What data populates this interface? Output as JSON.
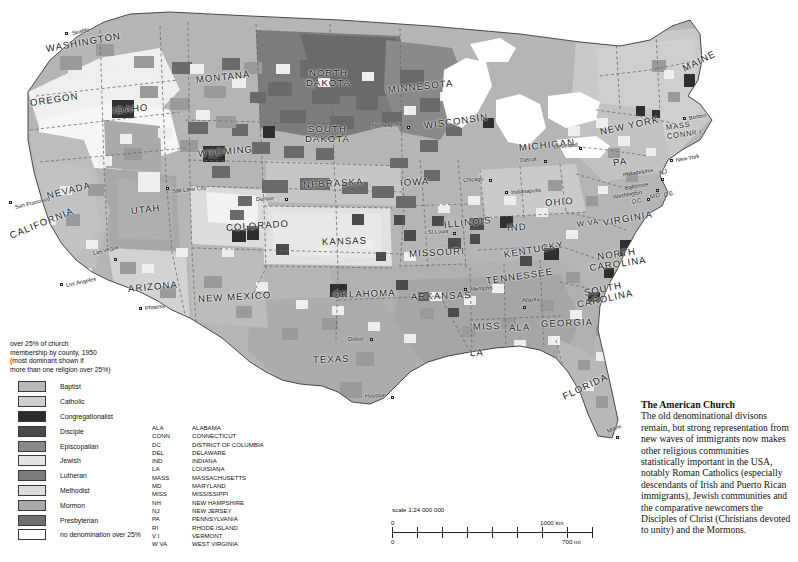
{
  "map": {
    "title": "The American Church",
    "states": [
      {
        "name": "WASHINGTON",
        "x": 46,
        "y": 43,
        "rot": -10,
        "size": "md"
      },
      {
        "name": "OREGON",
        "x": 30,
        "y": 97,
        "rot": -8,
        "size": "md"
      },
      {
        "name": "IDAHO",
        "x": 113,
        "y": 105,
        "rot": -6,
        "size": "md"
      },
      {
        "name": "MONTANA",
        "x": 196,
        "y": 74,
        "rot": -6,
        "size": "md"
      },
      {
        "name": "WYOMING",
        "x": 198,
        "y": 148,
        "rot": -5,
        "size": "md"
      },
      {
        "name": "NORTH DAKOTA",
        "x": 306,
        "y": 68,
        "rot": 0,
        "size": "md2"
      },
      {
        "name": "SOUTH DAKOTA",
        "x": 305,
        "y": 124,
        "rot": 0,
        "size": "md2"
      },
      {
        "name": "MINNESOTA",
        "x": 388,
        "y": 84,
        "rot": -6,
        "size": "md"
      },
      {
        "name": "WISCONSIN",
        "x": 424,
        "y": 120,
        "rot": -8,
        "size": "md"
      },
      {
        "name": "MICHIGAN",
        "x": 519,
        "y": 142,
        "rot": -6,
        "size": "md"
      },
      {
        "name": "NEVADA",
        "x": 47,
        "y": 190,
        "rot": -14,
        "size": "md"
      },
      {
        "name": "UTAH",
        "x": 131,
        "y": 205,
        "rot": -6,
        "size": "md"
      },
      {
        "name": "CALIFORNIA",
        "x": 10,
        "y": 230,
        "rot": -22,
        "size": "md"
      },
      {
        "name": "ARIZONA",
        "x": 128,
        "y": 283,
        "rot": -5,
        "size": "md"
      },
      {
        "name": "NEW MEXICO",
        "x": 198,
        "y": 293,
        "rot": -3,
        "size": "md"
      },
      {
        "name": "COLORADO",
        "x": 226,
        "y": 222,
        "rot": -4,
        "size": "md"
      },
      {
        "name": "NEBRASKA",
        "x": 303,
        "y": 179,
        "rot": -3,
        "size": "md"
      },
      {
        "name": "KANSAS",
        "x": 322,
        "y": 236,
        "rot": -2,
        "size": "md"
      },
      {
        "name": "OKLAHOMA",
        "x": 333,
        "y": 289,
        "rot": -2,
        "size": "md"
      },
      {
        "name": "TEXAS",
        "x": 313,
        "y": 354,
        "rot": -2,
        "size": "md"
      },
      {
        "name": "IOWA",
        "x": 400,
        "y": 177,
        "rot": -3,
        "size": "md"
      },
      {
        "name": "MISSOURI",
        "x": 409,
        "y": 248,
        "rot": -3,
        "size": "md"
      },
      {
        "name": "ILLINOIS",
        "x": 444,
        "y": 219,
        "rot": -6,
        "size": "md"
      },
      {
        "name": "IND",
        "x": 507,
        "y": 222,
        "rot": -4,
        "size": "md"
      },
      {
        "name": "OHIO",
        "x": 545,
        "y": 197,
        "rot": -4,
        "size": "md"
      },
      {
        "name": "ARKANSAS",
        "x": 411,
        "y": 291,
        "rot": -2,
        "size": "md"
      },
      {
        "name": "LA",
        "x": 470,
        "y": 347,
        "rot": -2,
        "size": "md"
      },
      {
        "name": "MISS",
        "x": 473,
        "y": 321,
        "rot": -2,
        "size": "md"
      },
      {
        "name": "ALA",
        "x": 509,
        "y": 322,
        "rot": -2,
        "size": "md"
      },
      {
        "name": "GEORGIA",
        "x": 541,
        "y": 318,
        "rot": -2,
        "size": "md"
      },
      {
        "name": "FLORIDA",
        "x": 563,
        "y": 391,
        "rot": -25,
        "size": "md"
      },
      {
        "name": "TENNESSEE",
        "x": 486,
        "y": 275,
        "rot": -8,
        "size": "md"
      },
      {
        "name": "KENTUCKY",
        "x": 504,
        "y": 249,
        "rot": -10,
        "size": "md"
      },
      {
        "name": "W VA",
        "x": 577,
        "y": 220,
        "rot": -8,
        "size": "sm"
      },
      {
        "name": "VIRGINIA",
        "x": 603,
        "y": 217,
        "rot": -10,
        "size": "md"
      },
      {
        "name": "NORTH CAROLINA",
        "x": 589,
        "y": 253,
        "rot": -8,
        "size": "md2"
      },
      {
        "name": "SOUTH CAROLINA",
        "x": 576,
        "y": 290,
        "rot": -12,
        "size": "md2"
      },
      {
        "name": "NEW YORK",
        "x": 600,
        "y": 126,
        "rot": -12,
        "size": "md"
      },
      {
        "name": "PA",
        "x": 613,
        "y": 157,
        "rot": -8,
        "size": "md"
      },
      {
        "name": "MAINE",
        "x": 683,
        "y": 63,
        "rot": -26,
        "size": "md"
      },
      {
        "name": "MASS",
        "x": 666,
        "y": 123,
        "rot": -8,
        "size": "sm"
      },
      {
        "name": "CONN",
        "x": 667,
        "y": 132,
        "rot": -8,
        "size": "sm"
      },
      {
        "name": "R I",
        "x": 692,
        "y": 129,
        "rot": -8,
        "size": "xs"
      },
      {
        "name": "NJ",
        "x": 659,
        "y": 169,
        "rot": -10,
        "size": "xs"
      },
      {
        "name": "MD",
        "x": 650,
        "y": 193,
        "rot": -14,
        "size": "xs"
      },
      {
        "name": "DE",
        "x": 664,
        "y": 191,
        "rot": -14,
        "size": "xs"
      },
      {
        "name": "DC",
        "x": 632,
        "y": 198,
        "rot": -12,
        "size": "xs"
      }
    ],
    "cities": [
      {
        "name": "Seattle",
        "x": 72,
        "y": 30,
        "rot": -12,
        "dx": -7,
        "dy": 2
      },
      {
        "name": "San Francisco",
        "x": 15,
        "y": 204,
        "rot": -14,
        "dx": -6,
        "dy": -3
      },
      {
        "name": "Los Angeles",
        "x": 66,
        "y": 282,
        "rot": -12,
        "dx": -6,
        "dy": 1
      },
      {
        "name": "Las Vegas",
        "x": 93,
        "y": 250,
        "rot": -14,
        "dx": 21,
        "dy": 8
      },
      {
        "name": "Salt Lake City",
        "x": 172,
        "y": 188,
        "rot": -6,
        "dx": -6,
        "dy": -1
      },
      {
        "name": "Phoenix",
        "x": 145,
        "y": 305,
        "rot": -6,
        "dx": -6,
        "dy": 2
      },
      {
        "name": "Denver",
        "x": 256,
        "y": 196,
        "rot": -3,
        "dx": 29,
        "dy": 2
      },
      {
        "name": "Dallas",
        "x": 348,
        "y": 336,
        "rot": -2,
        "dx": 22,
        "dy": 2
      },
      {
        "name": "Houston",
        "x": 365,
        "y": 393,
        "rot": -3,
        "dx": 26,
        "dy": 3
      },
      {
        "name": "Minneapolis",
        "x": 372,
        "y": 123,
        "rot": -4,
        "dx": 35,
        "dy": 3
      },
      {
        "name": "St Louis",
        "x": 428,
        "y": 229,
        "rot": -3,
        "dx": 25,
        "dy": 3
      },
      {
        "name": "Chicago",
        "x": 463,
        "y": 177,
        "rot": -4,
        "dx": 26,
        "dy": 2
      },
      {
        "name": "Memphis",
        "x": 470,
        "y": 286,
        "rot": -4,
        "dx": -6,
        "dy": 2
      },
      {
        "name": "Atlanta",
        "x": 522,
        "y": 297,
        "rot": -3,
        "dx": 1,
        "dy": 9
      },
      {
        "name": "Detroit",
        "x": 520,
        "y": 157,
        "rot": -4,
        "dx": 24,
        "dy": 3
      },
      {
        "name": "Cleveland",
        "x": 553,
        "y": 144,
        "rot": -6,
        "dx": 26,
        "dy": 3
      },
      {
        "name": "Indianapolis",
        "x": 511,
        "y": 189,
        "rot": -4,
        "dx": -6,
        "dy": 2
      },
      {
        "name": "Miami",
        "x": 607,
        "y": 428,
        "rot": -20,
        "dx": 9,
        "dy": 8
      },
      {
        "name": "Boston",
        "x": 689,
        "y": 115,
        "rot": -10,
        "dx": -6,
        "dy": 2
      },
      {
        "name": "New York",
        "x": 676,
        "y": 157,
        "rot": -10,
        "dx": -6,
        "dy": 2
      },
      {
        "name": "Philadelphia",
        "x": 623,
        "y": 172,
        "rot": -10,
        "dx": 38,
        "dy": 6
      },
      {
        "name": "Baltimore",
        "x": 625,
        "y": 185,
        "rot": -10,
        "dx": 31,
        "dy": 4
      },
      {
        "name": "Washington",
        "x": 613,
        "y": 194,
        "rot": -10,
        "dx": 34,
        "dy": 4
      }
    ]
  },
  "legend": {
    "header": "over 25% of church membership by county, 1950 (most dominant shown if more than one religion over 25%)",
    "header_lines": [
      "over 25% of church",
      "membership by county, 1950",
      "(most dominant shown if",
      "more than one religion over 25%)"
    ],
    "items": [
      {
        "label": "Baptist",
        "color": "#b9b9b9"
      },
      {
        "label": "Catholic",
        "color": "#cfcfcf"
      },
      {
        "label": "Congregationalist",
        "color": "#2c2c2c"
      },
      {
        "label": "Disciple",
        "color": "#4a4a4a"
      },
      {
        "label": "Episcopalian",
        "color": "#888888"
      },
      {
        "label": "Jewish",
        "color": "#e4e4e4"
      },
      {
        "label": "Lutheran",
        "color": "#7c7c7c"
      },
      {
        "label": "Methodist",
        "color": "#dcdcdc"
      },
      {
        "label": "Mormon",
        "color": "#a8a8a8"
      },
      {
        "label": "Presbyterian",
        "color": "#6e6e6e"
      },
      {
        "label": "no denomination over 25%",
        "color": "#ffffff"
      }
    ]
  },
  "abbreviations": [
    {
      "abbr": "ALA",
      "full": "ALABAMA"
    },
    {
      "abbr": "CONN",
      "full": "CONNECTICUT"
    },
    {
      "abbr": "DC",
      "full": "DISTRICT OF COLUMBIA"
    },
    {
      "abbr": "DEL",
      "full": "DELAWARE"
    },
    {
      "abbr": "IND",
      "full": "INDIANA"
    },
    {
      "abbr": "LA",
      "full": "LOUISIANA"
    },
    {
      "abbr": "MASS",
      "full": "MASSACHUSETTS"
    },
    {
      "abbr": "MD",
      "full": "MARYLAND"
    },
    {
      "abbr": "MISS",
      "full": "MISSISSIPPI"
    },
    {
      "abbr": "NH",
      "full": "NEW HAMPSHIRE"
    },
    {
      "abbr": "NJ",
      "full": "NEW JERSEY"
    },
    {
      "abbr": "PA",
      "full": "PENNSYLVANIA"
    },
    {
      "abbr": "RI",
      "full": "RHODE ISLAND"
    },
    {
      "abbr": "V I",
      "full": "VERMONT"
    },
    {
      "abbr": "W VA",
      "full": "WEST VIRGINIA"
    }
  ],
  "scale": {
    "title": "scale 1:24 000 000",
    "zero_km": "0",
    "max_km": "1000 km",
    "zero_mi": "0",
    "max_mi": "700 mi"
  },
  "caption": {
    "title": "The American Church",
    "body": "The old denominational divisons remain, but strong representation from new waves of immigrants now makes other religious communities statistically important in the USA, notably Roman Catholics (especially descendants of Irish and Puerto Rican immigrants), Jewish communities and the comparative newcomers the Disciples of Christ (Christians devoted to unity) and the Mormons."
  }
}
